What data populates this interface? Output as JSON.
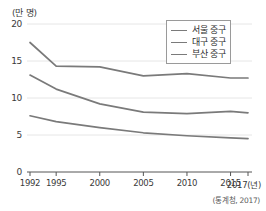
{
  "chart_data": {
    "type": "line",
    "title": "",
    "unit_label": "(만 명)",
    "xlabel": "(년)",
    "ylabel": "",
    "x": [
      1992,
      1995,
      2000,
      2005,
      2010,
      2015,
      2017
    ],
    "xtick_labels": [
      "1992",
      "1995",
      "2000",
      "2005",
      "2010",
      "2015",
      "2017(년)"
    ],
    "ytick_labels": [
      "0",
      "5",
      "10",
      "15",
      "20"
    ],
    "yticks": [
      0,
      5,
      10,
      15,
      20
    ],
    "ylim": [
      0,
      20
    ],
    "grid": true,
    "legend_position": "top-right",
    "series": [
      {
        "name": "서울 중구",
        "color": "#7a7a7a",
        "values": [
          17.5,
          14.3,
          14.2,
          13.0,
          13.3,
          12.7,
          12.7
        ]
      },
      {
        "name": "대구 중구",
        "color": "#7a7a7a",
        "values": [
          13.1,
          11.2,
          9.2,
          8.1,
          7.9,
          8.2,
          8.0
        ]
      },
      {
        "name": "부산 중구",
        "color": "#7a7a7a",
        "values": [
          7.6,
          6.8,
          6.0,
          5.3,
          4.9,
          4.6,
          4.5
        ]
      }
    ],
    "source_note": "(통계청, 2017)"
  }
}
